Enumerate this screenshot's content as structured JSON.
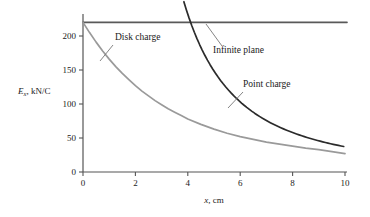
{
  "chart_data": {
    "type": "line",
    "title": "",
    "xlabel": "x, cm",
    "ylabel": "E_x, kN/C",
    "ylabel_parts": {
      "symbol": "E",
      "subscript": "x",
      "unit": ", kN/C"
    },
    "xlim": [
      0,
      10
    ],
    "ylim": [
      0,
      240
    ],
    "xticks": [
      0,
      2,
      4,
      6,
      8,
      10
    ],
    "xtick_labels": [
      "0",
      "2",
      "4",
      "6",
      "8",
      "10"
    ],
    "yticks": [
      0,
      50,
      100,
      150,
      200
    ],
    "ytick_labels": [
      "0",
      "50",
      "100",
      "150",
      "200"
    ],
    "grid": false,
    "legend": "annotations",
    "x": [
      0,
      0.25,
      0.5,
      0.75,
      1,
      1.25,
      1.5,
      1.75,
      2,
      2.25,
      2.5,
      2.75,
      3,
      3.25,
      3.5,
      3.75,
      4,
      4.5,
      5,
      5.5,
      6,
      6.5,
      7,
      7.5,
      8,
      8.5,
      9,
      9.5,
      10
    ],
    "series": [
      {
        "name": "Infinite plane",
        "color": "#595959",
        "width": 1.6,
        "kind": "horizontal",
        "value": 220,
        "values": [
          220,
          220,
          220,
          220,
          220,
          220,
          220,
          220,
          220,
          220,
          220,
          220,
          220,
          220,
          220,
          220,
          220,
          220,
          220,
          220,
          220,
          220,
          220,
          220,
          220,
          220,
          220,
          220,
          220
        ]
      },
      {
        "name": "Disk charge",
        "color": "#9a9a9a",
        "width": 1.7,
        "kind": "disk",
        "values": [
          220,
          205,
          191,
          178,
          166,
          155,
          145,
          136,
          127,
          119,
          112,
          105,
          99,
          93,
          88,
          83,
          78,
          70,
          63,
          57,
          52,
          48,
          44,
          41,
          38,
          35,
          33,
          30,
          27
        ]
      },
      {
        "name": "Point charge",
        "color": "#2b2b2b",
        "width": 1.7,
        "kind": "point",
        "x_start": 3.05,
        "values": [
          null,
          null,
          null,
          null,
          null,
          null,
          null,
          null,
          null,
          null,
          null,
          null,
          null,
          410,
          305,
          265,
          232,
          185,
          150,
          124,
          104,
          88,
          76,
          66,
          58,
          52,
          46,
          41,
          37
        ]
      }
    ],
    "annotations": [
      {
        "name": "disk-charge",
        "text": "Disk charge",
        "text_x": 115,
        "text_y": 40,
        "leader": [
          [
            113,
            45
          ],
          [
            100,
            61
          ]
        ]
      },
      {
        "name": "infinite-plane",
        "text": "Infinite plane",
        "text_x": 213,
        "text_y": 53,
        "leader": [
          [
            222,
            46
          ],
          [
            206,
            24
          ]
        ]
      },
      {
        "name": "point-charge",
        "text": "Point charge",
        "text_x": 243,
        "text_y": 87,
        "leader": [
          [
            243,
            92
          ],
          [
            228,
            108
          ]
        ]
      }
    ]
  },
  "colors": {
    "axis": "#555555",
    "text": "#1a1a1a",
    "infinite_plane": "#595959",
    "disk_charge": "#9a9a9a",
    "point_charge": "#2b2b2b",
    "background": "#ffffff"
  }
}
